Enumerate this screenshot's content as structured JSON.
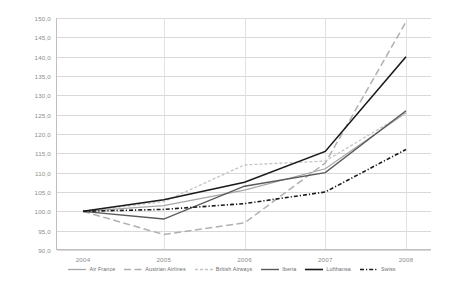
{
  "chart_data": {
    "type": "line",
    "title": "",
    "subtitle": "",
    "xlabel": "",
    "ylabel": "",
    "categories": [
      "2004",
      "2005",
      "2006",
      "2007",
      "2008"
    ],
    "x": [
      2004,
      2005,
      2006,
      2007,
      2008
    ],
    "ylim": [
      90.0,
      150.0
    ],
    "yticks": [
      "90,0",
      "95,0",
      "100,0",
      "105,0",
      "110,0",
      "115,0",
      "120,0",
      "125,0",
      "130,0",
      "135,0",
      "140,0",
      "145,0",
      "150,0"
    ],
    "ytick_values": [
      90.0,
      95.0,
      100.0,
      105.0,
      110.0,
      115.0,
      120.0,
      125.0,
      130.0,
      135.0,
      140.0,
      145.0,
      150.0
    ],
    "grid": true,
    "legend_position": "bottom",
    "series": [
      {
        "name": "Air France",
        "values": [
          100.0,
          101.5,
          105.5,
          111.0,
          125.5
        ],
        "color": "#a6a6a6",
        "style": "solid",
        "width": 1.2
      },
      {
        "name": "Austrian Airlines",
        "values": [
          100.0,
          94.0,
          97.0,
          112.5,
          149.0
        ],
        "color": "#b0b0b0",
        "style": "long-dash",
        "width": 1.5
      },
      {
        "name": "British Airways",
        "values": [
          100.0,
          102.5,
          112.0,
          113.0,
          125.5
        ],
        "color": "#c4c4c4",
        "style": "short-dash",
        "width": 1.3
      },
      {
        "name": "Iberia",
        "values": [
          100.0,
          98.0,
          106.5,
          110.0,
          126.0
        ],
        "color": "#595959",
        "style": "solid",
        "width": 1.4
      },
      {
        "name": "Lufthansa",
        "values": [
          100.0,
          103.0,
          107.5,
          115.5,
          140.0
        ],
        "color": "#1a1a1a",
        "style": "solid",
        "width": 1.6
      },
      {
        "name": "Swiss",
        "values": [
          100.0,
          100.5,
          102.0,
          105.0,
          116.0
        ],
        "color": "#1a1a1a",
        "style": "dot-dash",
        "width": 1.6
      }
    ]
  },
  "colors": {
    "background": "#ffffff",
    "grid": "#d9d9d9",
    "axis": "#bfbfbf",
    "tick_text": "#8c8c8c"
  }
}
